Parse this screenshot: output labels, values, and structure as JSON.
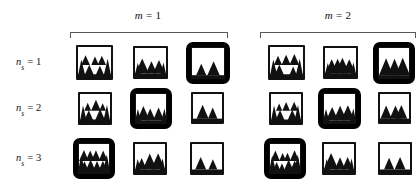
{
  "figure": {
    "type": "image-grid",
    "background_color": "#ffffff",
    "line_color": "#585858",
    "ink_color": "#111111",
    "highlight_color": "#000000"
  },
  "column_groups": [
    {
      "id": "m1",
      "label_prefix": "m",
      "label_equals": "=",
      "label_value": "1",
      "label_full": "m = 1",
      "columns": 3
    },
    {
      "id": "m2",
      "label_prefix": "m",
      "label_equals": "=",
      "label_value": "2",
      "label_full": "m = 2",
      "columns": 3
    }
  ],
  "rows": [
    {
      "id": "ns1",
      "label_prefix": "n",
      "label_subscript": "s",
      "label_equals": "=",
      "label_value": "1",
      "label_full": "n_s = 1"
    },
    {
      "id": "ns2",
      "label_prefix": "n",
      "label_subscript": "s",
      "label_equals": "=",
      "label_value": "2",
      "label_full": "n_s = 2"
    },
    {
      "id": "ns3",
      "label_prefix": "n",
      "label_subscript": "s",
      "label_equals": "=",
      "label_value": "3",
      "label_full": "n_s = 3"
    }
  ],
  "cells": [
    {
      "row": "ns1",
      "group": "m1",
      "col": 1,
      "highlighted": false,
      "scene": "forest-dense",
      "tree_count": 5,
      "x": 76,
      "y": 45,
      "w": 37,
      "h": 35
    },
    {
      "row": "ns1",
      "group": "m1",
      "col": 2,
      "highlighted": false,
      "scene": "forest-sparse",
      "tree_count": 3,
      "x": 133,
      "y": 46,
      "w": 35,
      "h": 33
    },
    {
      "row": "ns1",
      "group": "m1",
      "col": 3,
      "highlighted": true,
      "scene": "forest-minimal",
      "tree_count": 2,
      "x": 186,
      "y": 42,
      "w": 44,
      "h": 42
    },
    {
      "row": "ns1",
      "group": "m2",
      "col": 1,
      "highlighted": false,
      "scene": "forest-dense",
      "tree_count": 5,
      "x": 268,
      "y": 45,
      "w": 37,
      "h": 35
    },
    {
      "row": "ns1",
      "group": "m2",
      "col": 2,
      "highlighted": false,
      "scene": "forest-sparse",
      "tree_count": 4,
      "x": 323,
      "y": 46,
      "w": 35,
      "h": 33
    },
    {
      "row": "ns1",
      "group": "m2",
      "col": 3,
      "highlighted": true,
      "scene": "forest-minimal",
      "tree_count": 3,
      "x": 373,
      "y": 42,
      "w": 42,
      "h": 42
    },
    {
      "row": "ns2",
      "group": "m1",
      "col": 1,
      "highlighted": false,
      "scene": "forest-dense",
      "tree_count": 5,
      "x": 78,
      "y": 92,
      "w": 34,
      "h": 33
    },
    {
      "row": "ns2",
      "group": "m1",
      "col": 2,
      "highlighted": true,
      "scene": "forest-sparse",
      "tree_count": 3,
      "x": 130,
      "y": 88,
      "w": 42,
      "h": 41
    },
    {
      "row": "ns2",
      "group": "m1",
      "col": 3,
      "highlighted": false,
      "scene": "forest-minimal",
      "tree_count": 2,
      "x": 191,
      "y": 92,
      "w": 33,
      "h": 32
    },
    {
      "row": "ns2",
      "group": "m2",
      "col": 1,
      "highlighted": false,
      "scene": "forest-dense",
      "tree_count": 5,
      "x": 269,
      "y": 92,
      "w": 34,
      "h": 33
    },
    {
      "row": "ns2",
      "group": "m2",
      "col": 2,
      "highlighted": true,
      "scene": "forest-sparse",
      "tree_count": 3,
      "x": 318,
      "y": 88,
      "w": 43,
      "h": 41
    },
    {
      "row": "ns2",
      "group": "m2",
      "col": 3,
      "highlighted": false,
      "scene": "forest-minimal",
      "tree_count": 3,
      "x": 378,
      "y": 92,
      "w": 33,
      "h": 32
    },
    {
      "row": "ns3",
      "group": "m1",
      "col": 1,
      "highlighted": true,
      "scene": "forest-very-dense",
      "tree_count": 8,
      "x": 73,
      "y": 138,
      "w": 42,
      "h": 41
    },
    {
      "row": "ns3",
      "group": "m1",
      "col": 2,
      "highlighted": false,
      "scene": "forest-sparse",
      "tree_count": 3,
      "x": 133,
      "y": 142,
      "w": 34,
      "h": 33
    },
    {
      "row": "ns3",
      "group": "m1",
      "col": 3,
      "highlighted": false,
      "scene": "forest-minimal",
      "tree_count": 2,
      "x": 190,
      "y": 142,
      "w": 34,
      "h": 33
    },
    {
      "row": "ns3",
      "group": "m2",
      "col": 1,
      "highlighted": true,
      "scene": "forest-very-dense",
      "tree_count": 8,
      "x": 264,
      "y": 138,
      "w": 42,
      "h": 41
    },
    {
      "row": "ns3",
      "group": "m2",
      "col": 2,
      "highlighted": false,
      "scene": "forest-sparse",
      "tree_count": 3,
      "x": 322,
      "y": 142,
      "w": 34,
      "h": 33
    },
    {
      "row": "ns3",
      "group": "m2",
      "col": 3,
      "highlighted": false,
      "scene": "forest-minimal",
      "tree_count": 2,
      "x": 378,
      "y": 142,
      "w": 34,
      "h": 33
    }
  ],
  "brackets": [
    {
      "group": "m1",
      "x": 70,
      "y": 32,
      "w": 158
    },
    {
      "group": "m2",
      "x": 260,
      "y": 32,
      "w": 156
    }
  ],
  "header_positions": [
    {
      "group": "m1",
      "x": 108,
      "y": 9,
      "w": 80
    },
    {
      "group": "m2",
      "x": 298,
      "y": 9,
      "w": 80
    }
  ],
  "row_label_positions": [
    {
      "row": "ns1",
      "x": 16,
      "y": 56
    },
    {
      "row": "ns2",
      "x": 16,
      "y": 102
    },
    {
      "row": "ns3",
      "x": 16,
      "y": 152
    }
  ]
}
